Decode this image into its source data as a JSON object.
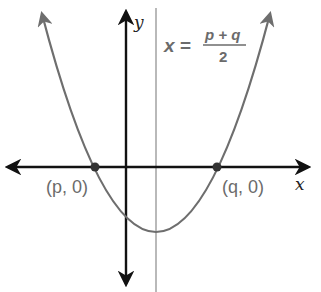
{
  "diagram": {
    "title": "",
    "axes": {
      "x_label": "x",
      "y_label": "y"
    },
    "axis_of_symmetry": {
      "lhs": "x",
      "eq": "=",
      "numerator": "p + q",
      "denominator": "2"
    },
    "points": [
      {
        "label": "(p, 0)",
        "role": "left-root"
      },
      {
        "label": "(q, 0)",
        "role": "right-root"
      }
    ],
    "colors": {
      "axis": "#111111",
      "curve": "#6e6e6e",
      "symmetry_line": "#8a8a8a",
      "label": "#6b6b6b"
    }
  }
}
